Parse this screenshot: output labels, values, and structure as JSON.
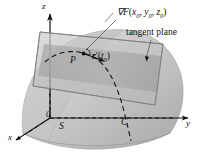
{
  "figure": {
    "background_color": "#ffffff"
  },
  "labels": {
    "gradient": "∇F(x₀, y₀, z₀)",
    "gradient_symbol": "∇F",
    "gradient_args_open": "(",
    "gradient_x": "x",
    "gradient_sub0a": "0",
    "gradient_comma1": ", ",
    "gradient_y": "y",
    "gradient_sub0b": "0",
    "gradient_comma2": ", ",
    "gradient_z": "z",
    "gradient_sub0c": "0",
    "gradient_args_close": ")",
    "tangent_plane": "tangent plane",
    "point_P": "P",
    "tangent_vector": "r′(t₀)",
    "tangent_vector_r": "r",
    "tangent_vector_prime": "′(",
    "tangent_vector_t": "t",
    "tangent_vector_sub0": "0",
    "tangent_vector_close": ")",
    "axis_z": "z",
    "axis_y": "y",
    "axis_x": "x",
    "origin": "0",
    "surface_S": "S",
    "curve_C": "C"
  },
  "colors": {
    "surface_light": "#d2d2d2",
    "surface_mid": "#c0c0c0",
    "surface_dark": "#ababab",
    "plane_light": "#c8c8c8",
    "plane_dark": "#a8a8a8",
    "stroke": "#111111",
    "text": "#111111",
    "background": "#ffffff"
  },
  "geometry": {
    "surface_description": "shaded dome-like level surface S",
    "plane_description": "tilted semi-transparent parallelogram tangent plane",
    "curve_description": "dashed curve C lying on the surface passing through P",
    "axes": [
      "x",
      "y",
      "z"
    ]
  }
}
